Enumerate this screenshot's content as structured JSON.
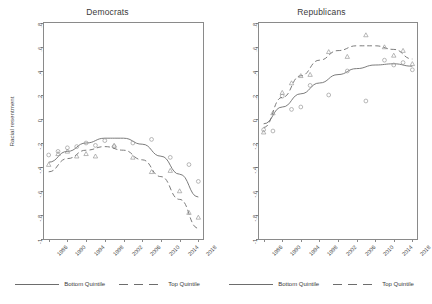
{
  "figure": {
    "ylabel": "Racial resentment"
  },
  "legend": {
    "bottom_label": "Bottom Quintile",
    "top_label": "Top Quintile",
    "bottom_style": "solid",
    "top_style": "dashed",
    "color": "#6d6d6d"
  },
  "chart_data": [
    {
      "type": "scatter",
      "title": "Democrats",
      "xlabel": "",
      "ylabel": "Racial resentment",
      "xlim": [
        1985,
        2019
      ],
      "ylim": [
        -1.0,
        0.8
      ],
      "yticks": [
        0.8,
        0.6,
        0.4,
        0.2,
        0,
        -0.2,
        -0.4,
        -0.6,
        -0.8,
        -1.0
      ],
      "ytick_labels": [
        ".8",
        ".6",
        ".4",
        ".2",
        "0",
        "-.2",
        "-.4",
        "-.6",
        "-.8",
        "-1"
      ],
      "xticks": [
        1986,
        1990,
        1994,
        1998,
        2002,
        2006,
        2010,
        2014,
        2018
      ],
      "xtick_labels": [
        "1986",
        "1990",
        "1994",
        "1998",
        "2002",
        "2006",
        "2010",
        "2014",
        "2018"
      ],
      "grid": false,
      "legend_position": "below",
      "series": [
        {
          "name": "Bottom Quintile",
          "marker": "circle",
          "line": "solid",
          "points": [
            {
              "x": 1986,
              "y": -0.3
            },
            {
              "x": 1988,
              "y": -0.27
            },
            {
              "x": 1990,
              "y": -0.24
            },
            {
              "x": 1992,
              "y": -0.23
            },
            {
              "x": 1994,
              "y": -0.2
            },
            {
              "x": 1996,
              "y": -0.22
            },
            {
              "x": 1998,
              "y": -0.18
            },
            {
              "x": 2000,
              "y": -0.23
            },
            {
              "x": 2004,
              "y": -0.2
            },
            {
              "x": 2008,
              "y": -0.17
            },
            {
              "x": 2012,
              "y": -0.32
            },
            {
              "x": 2016,
              "y": -0.38
            },
            {
              "x": 2018,
              "y": -0.52
            }
          ],
          "fit": [
            {
              "x": 1986,
              "y": -0.36
            },
            {
              "x": 1990,
              "y": -0.27
            },
            {
              "x": 1994,
              "y": -0.2
            },
            {
              "x": 1998,
              "y": -0.16
            },
            {
              "x": 2002,
              "y": -0.16
            },
            {
              "x": 2006,
              "y": -0.21
            },
            {
              "x": 2010,
              "y": -0.31
            },
            {
              "x": 2014,
              "y": -0.46
            },
            {
              "x": 2018,
              "y": -0.65
            }
          ]
        },
        {
          "name": "Top Quintile",
          "marker": "triangle",
          "line": "dashed",
          "points": [
            {
              "x": 1986,
              "y": -0.38
            },
            {
              "x": 1988,
              "y": -0.29
            },
            {
              "x": 1990,
              "y": -0.27
            },
            {
              "x": 1992,
              "y": -0.31
            },
            {
              "x": 1994,
              "y": -0.29
            },
            {
              "x": 1996,
              "y": -0.31
            },
            {
              "x": 2000,
              "y": -0.22
            },
            {
              "x": 2004,
              "y": -0.32
            },
            {
              "x": 2008,
              "y": -0.44
            },
            {
              "x": 2012,
              "y": -0.43
            },
            {
              "x": 2014,
              "y": -0.6
            },
            {
              "x": 2016,
              "y": -0.78
            },
            {
              "x": 2018,
              "y": -0.82
            }
          ],
          "fit": [
            {
              "x": 1986,
              "y": -0.44
            },
            {
              "x": 1990,
              "y": -0.33
            },
            {
              "x": 1994,
              "y": -0.26
            },
            {
              "x": 1998,
              "y": -0.23
            },
            {
              "x": 2002,
              "y": -0.26
            },
            {
              "x": 2006,
              "y": -0.34
            },
            {
              "x": 2010,
              "y": -0.48
            },
            {
              "x": 2014,
              "y": -0.67
            },
            {
              "x": 2018,
              "y": -0.91
            }
          ]
        }
      ]
    },
    {
      "type": "scatter",
      "title": "Republicans",
      "xlabel": "",
      "ylabel": "",
      "xlim": [
        1985,
        2019
      ],
      "ylim": [
        -1.0,
        0.8
      ],
      "yticks": [
        0.8,
        0.6,
        0.4,
        0.2,
        0,
        -0.2,
        -0.4,
        -0.6,
        -0.8,
        -1.0
      ],
      "ytick_labels": [
        ".8",
        ".6",
        ".4",
        ".2",
        "0",
        "-.2",
        "-.4",
        "-.6",
        "-.8",
        "-1"
      ],
      "xticks": [
        1986,
        1990,
        1994,
        1998,
        2002,
        2006,
        2010,
        2014,
        2018
      ],
      "xtick_labels": [
        "1986",
        "1990",
        "1994",
        "1998",
        "2002",
        "2006",
        "2010",
        "2014",
        "2018"
      ],
      "grid": false,
      "legend_position": "below",
      "series": [
        {
          "name": "Bottom Quintile",
          "marker": "circle",
          "line": "solid",
          "points": [
            {
              "x": 1986,
              "y": -0.09
            },
            {
              "x": 1988,
              "y": -0.1
            },
            {
              "x": 1990,
              "y": 0.19
            },
            {
              "x": 1992,
              "y": 0.08
            },
            {
              "x": 1994,
              "y": 0.1
            },
            {
              "x": 1996,
              "y": 0.28
            },
            {
              "x": 2000,
              "y": 0.2
            },
            {
              "x": 2004,
              "y": 0.4
            },
            {
              "x": 2008,
              "y": 0.15
            },
            {
              "x": 2012,
              "y": 0.49
            },
            {
              "x": 2014,
              "y": 0.45
            },
            {
              "x": 2016,
              "y": 0.47
            },
            {
              "x": 2018,
              "y": 0.41
            }
          ],
          "fit": [
            {
              "x": 1986,
              "y": -0.04
            },
            {
              "x": 1990,
              "y": 0.1
            },
            {
              "x": 1994,
              "y": 0.21
            },
            {
              "x": 1998,
              "y": 0.3
            },
            {
              "x": 2002,
              "y": 0.37
            },
            {
              "x": 2006,
              "y": 0.42
            },
            {
              "x": 2010,
              "y": 0.45
            },
            {
              "x": 2014,
              "y": 0.46
            },
            {
              "x": 2018,
              "y": 0.44
            }
          ]
        },
        {
          "name": "Top Quintile",
          "marker": "triangle",
          "line": "dashed",
          "points": [
            {
              "x": 1986,
              "y": -0.11
            },
            {
              "x": 1988,
              "y": 0.05
            },
            {
              "x": 1990,
              "y": 0.22
            },
            {
              "x": 1992,
              "y": 0.3
            },
            {
              "x": 1994,
              "y": 0.36
            },
            {
              "x": 1996,
              "y": 0.37
            },
            {
              "x": 2000,
              "y": 0.56
            },
            {
              "x": 2004,
              "y": 0.52
            },
            {
              "x": 2008,
              "y": 0.7
            },
            {
              "x": 2012,
              "y": 0.6
            },
            {
              "x": 2014,
              "y": 0.53
            },
            {
              "x": 2016,
              "y": 0.57
            },
            {
              "x": 2018,
              "y": 0.46
            }
          ],
          "fit": [
            {
              "x": 1986,
              "y": -0.07
            },
            {
              "x": 1990,
              "y": 0.18
            },
            {
              "x": 1994,
              "y": 0.36
            },
            {
              "x": 1998,
              "y": 0.49
            },
            {
              "x": 2002,
              "y": 0.57
            },
            {
              "x": 2006,
              "y": 0.61
            },
            {
              "x": 2010,
              "y": 0.61
            },
            {
              "x": 2014,
              "y": 0.58
            },
            {
              "x": 2018,
              "y": 0.5
            }
          ]
        }
      ]
    }
  ]
}
